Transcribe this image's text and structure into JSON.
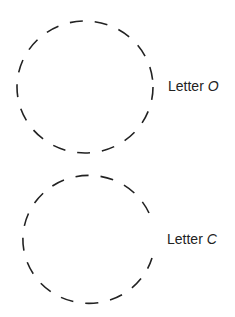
{
  "figure": {
    "items": [
      {
        "label_prefix": "Letter",
        "letter": "O",
        "shape": "dashed-closed-circle"
      },
      {
        "label_prefix": "Letter",
        "letter": "C",
        "shape": "dashed-circle-with-gap"
      }
    ],
    "stroke_color": "#222222",
    "background": "#ffffff"
  }
}
